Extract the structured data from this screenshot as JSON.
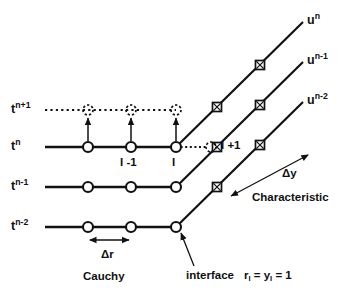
{
  "figure": {
    "type": "stencil-diagram",
    "background_color": "#ffffff",
    "line_color": "#111111"
  },
  "time_levels": [
    {
      "id": "tnp1",
      "label_base": "t",
      "label_sup": "n+1",
      "text": "t n+1",
      "y": 110,
      "style": "dotted",
      "x_start": 45,
      "x_end": 176
    },
    {
      "id": "tn",
      "label_base": "t",
      "label_sup": "n",
      "text": "t n",
      "y": 147,
      "style": "solid",
      "x_start": 45,
      "x_end": 176
    },
    {
      "id": "tnm1",
      "label_base": "t",
      "label_sup": "n-1",
      "text": "t n-1",
      "y": 187,
      "style": "solid",
      "x_start": 45,
      "x_end": 176
    },
    {
      "id": "tnm2",
      "label_base": "t",
      "label_sup": "n-2",
      "text": "t n-2",
      "y": 227,
      "style": "solid",
      "x_start": 45,
      "x_end": 176
    }
  ],
  "characteristics": [
    {
      "id": "un",
      "label_base": "u",
      "label_sup": "n",
      "text": "u n",
      "from": [
        176,
        147
      ],
      "to": [
        303,
        22
      ],
      "markers": [
        [
          217,
          107
        ],
        [
          260,
          65
        ]
      ]
    },
    {
      "id": "unm1",
      "label_base": "u",
      "label_sup": "n-1",
      "text": "u n-1",
      "from": [
        176,
        187
      ],
      "to": [
        303,
        62
      ],
      "markers": [
        [
          217,
          147
        ],
        [
          260,
          105
        ]
      ]
    },
    {
      "id": "unm2",
      "label_base": "u",
      "label_sup": "n-2",
      "text": "u n-2",
      "from": [
        176,
        227
      ],
      "to": [
        303,
        102
      ],
      "markers": [
        [
          217,
          187
        ],
        [
          260,
          145
        ]
      ]
    }
  ],
  "node_x_positions": [
    88,
    131,
    176
  ],
  "node_labels": [
    {
      "id": "i-minus-1",
      "text": "I -1",
      "x": 120,
      "y": 157
    },
    {
      "id": "i",
      "text": "I",
      "x": 172,
      "y": 157
    },
    {
      "id": "i-plus-1",
      "text": "I +1",
      "x": 222,
      "y": 140
    }
  ],
  "ghost_node_i_plus_1": {
    "x": 211,
    "y": 147
  },
  "annotations": {
    "delta_r": {
      "text": "Δr",
      "x": 101,
      "y": 255,
      "arrow_from": 88,
      "arrow_to": 131,
      "arrow_y": 240
    },
    "delta_y": {
      "text": "Δy",
      "x": 285,
      "y": 177,
      "arrow_from": [
        308,
        155
      ],
      "arrow_to": [
        231,
        196
      ]
    },
    "cauchy": {
      "text": "Cauchy",
      "x": 83,
      "y": 277
    },
    "characteristic": {
      "text": "Characteristic",
      "x": 268,
      "y": 199
    },
    "interface": {
      "text": "interface",
      "x": 185,
      "y": 276,
      "pointer_from": [
        192,
        268
      ],
      "pointer_to": [
        180,
        232
      ]
    },
    "interface_value": {
      "segments": [
        "r",
        "I",
        " = ",
        "y",
        "I",
        " = 1"
      ],
      "text": "r I = y I = 1",
      "x": 243,
      "y": 276
    }
  },
  "markers": {
    "circle": {
      "name": "open-circle-node",
      "radius": 5,
      "fill": "#ffffff",
      "stroke": "#111111"
    },
    "dashed_circle": {
      "name": "dashed-open-circle-node",
      "radius": 5,
      "fill": "none",
      "stroke": "#111111"
    },
    "square_x": {
      "name": "square-with-cross-marker",
      "size": 9,
      "fill": "#ffffff",
      "stroke": "#111111"
    }
  }
}
